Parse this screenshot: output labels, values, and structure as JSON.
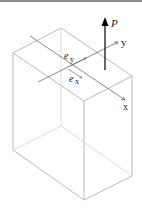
{
  "figure": {
    "labels": {
      "load": "P",
      "axis_y": "y",
      "axis_x": "x",
      "ecc_y_base": "e",
      "ecc_y_sub": "y",
      "ecc_x_base": "e",
      "ecc_x_sub": "x"
    },
    "colors": {
      "edge": "#a0a0a0",
      "arrow": "#333333",
      "load": "#000000",
      "top_border": "#8a8a8a"
    }
  }
}
